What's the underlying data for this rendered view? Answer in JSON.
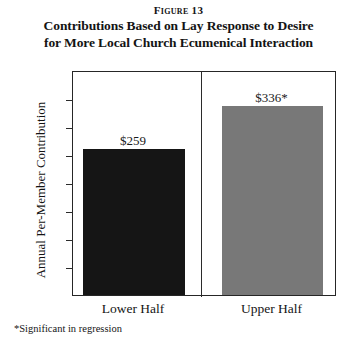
{
  "figure": {
    "label": "Figure 13",
    "title_line1": "Contributions Based on Lay Response to Desire",
    "title_line2": "for More Local Church Ecumenical Interaction",
    "footnote": "*Significant in regression"
  },
  "colors": {
    "bar_lower": "#151515",
    "bar_upper": "#787878",
    "axis": "#262626",
    "text": "#141414",
    "background": "#ffffff"
  },
  "chart_data": {
    "type": "bar",
    "title": "Contributions Based on Lay Response to Desire for More Local Church Ecumenical Interaction",
    "categories": [
      "Lower Half",
      "Upper Half"
    ],
    "values": [
      259,
      336
    ],
    "value_labels": [
      "$259",
      "$336*"
    ],
    "bar_colors": [
      "#151515",
      "#787878"
    ],
    "xlabel": "",
    "ylabel": "Annual Per-Member Contribution",
    "ylim": [
      0,
      400
    ],
    "ytick_step": 50,
    "ytick_labels": [
      "400",
      "350",
      "300",
      "250",
      "200",
      "150",
      "100",
      "50",
      "0"
    ],
    "ytick_values": [
      400,
      350,
      300,
      250,
      200,
      150,
      100,
      50,
      0
    ],
    "grid": false,
    "legend": "none",
    "annotations": [
      "*Significant in regression"
    ]
  }
}
